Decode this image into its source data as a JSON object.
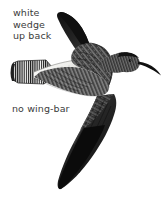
{
  "plate": {
    "width": 163,
    "height": 199,
    "background_color": "#ffffff",
    "subject": "shorebird-in-flight",
    "style": "field-guide-illustration"
  },
  "annotations": {
    "white_wedge": {
      "text": "white\nwedge\nup back",
      "lines": [
        "white",
        "wedge",
        "up back"
      ],
      "color": "#3b3b3b"
    },
    "no_wing_bar": {
      "text": "no wing-bar",
      "lines": [
        "no wing-bar"
      ],
      "color": "#3b3b3b"
    }
  },
  "bird": {
    "parts": {
      "bill": "long-decurved-bill",
      "head": "streaked-dark-head",
      "upper_wing": "raised-dark-mottled-wing",
      "lower_wing": "swept-down-dark-wing-black-tip",
      "back_wedge": "white-wedge-up-back",
      "tail": "finely-barred-black-white-tail",
      "body": "streaked-barred-underparts"
    },
    "colors": {
      "ink_black": "#121212",
      "dark_gray": "#2c2c2c",
      "mid_gray": "#5e5e5e",
      "light_gray": "#b8b8b8",
      "pale": "#e9e9e7",
      "white": "#ffffff"
    }
  }
}
